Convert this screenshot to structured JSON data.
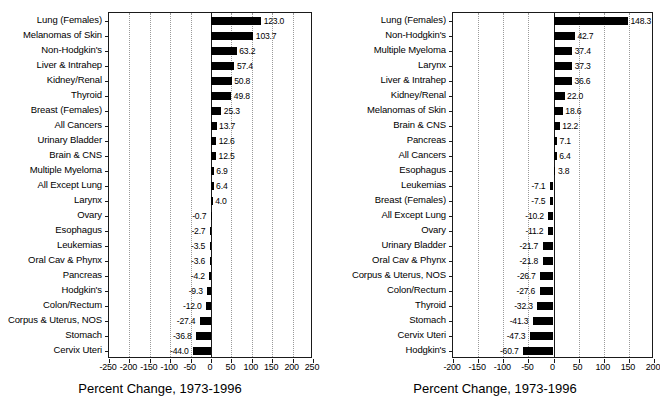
{
  "figure": {
    "background_color": "#ffffff",
    "bar_color": "#000000",
    "axis_color": "#1a1a1a",
    "grid_color": "#9a9a9a"
  },
  "charts": [
    {
      "id": "left",
      "title": "",
      "axis_title": "Percent Change, 1973-1996",
      "type": "bar",
      "orientation": "horizontal",
      "xlabel": "Percent Change, 1973-1996",
      "ylabel": "",
      "xlim": [
        -250,
        250
      ],
      "xticks": [
        -250,
        -200,
        -150,
        -100,
        -50,
        0,
        50,
        100,
        150,
        200,
        250
      ],
      "xticklabels": [
        "-250",
        "-200",
        "-150",
        "-100",
        "-50",
        "0",
        "50",
        "100",
        "150",
        "200",
        "250"
      ],
      "grid": true,
      "legend": "none",
      "categories": [
        "Lung (Females)",
        "Melanomas of Skin",
        "Non-Hodgkin's",
        "Liver & Intrahep",
        "Kidney/Renal",
        "Thyroid",
        "Breast (Females)",
        "All Cancers",
        "Urinary Bladder",
        "Brain & CNS",
        "Multiple Myeloma",
        "All Except Lung",
        "Larynx",
        "Ovary",
        "Esophagus",
        "Leukemias",
        "Oral Cav & Phynx",
        "Pancreas",
        "Hodgkin's",
        "Colon/Rectum",
        "Corpus & Uterus, NOS",
        "Stomach",
        "Cervix Uteri"
      ],
      "values": [
        123.0,
        103.7,
        63.2,
        57.4,
        50.8,
        49.8,
        25.3,
        13.7,
        12.6,
        12.5,
        6.9,
        6.4,
        4.0,
        -0.7,
        -2.7,
        -3.5,
        -3.6,
        -4.2,
        -9.3,
        -12.0,
        -27.4,
        -36.8,
        -44.0
      ],
      "datalabels": [
        "123.0",
        "103.7",
        "63.2",
        "57.4",
        "50.8",
        "49.8",
        "25.3",
        "13.7",
        "12.6",
        "12.5",
        "6.9",
        "6.4",
        "4.0",
        "-0.7",
        "-2.7",
        "-3.5",
        "-3.6",
        "-4.2",
        "-9.3",
        "-12.0",
        "-27.4",
        "-36.8",
        "-44.0"
      ]
    },
    {
      "id": "right",
      "title": "",
      "axis_title": "Percent Change, 1973-1996",
      "type": "bar",
      "orientation": "horizontal",
      "xlabel": "Percent Change, 1973-1996",
      "ylabel": "",
      "xlim": [
        -200,
        200
      ],
      "xticks": [
        -200,
        -150,
        -100,
        -50,
        0,
        50,
        100,
        150,
        200
      ],
      "xticklabels": [
        "-200",
        "-150",
        "-100",
        "-50",
        "0",
        "50",
        "100",
        "150",
        "200"
      ],
      "grid": true,
      "legend": "none",
      "categories": [
        "Lung (Females)",
        "Non-Hodgkin's",
        "Multiple Myeloma",
        "Larynx",
        "Liver & Intrahep",
        "Kidney/Renal",
        "Melanomas of Skin",
        "Brain & CNS",
        "Pancreas",
        "All Cancers",
        "Esophagus",
        "Leukemias",
        "Breast (Females)",
        "All Except Lung",
        "Ovary",
        "Urinary Bladder",
        "Oral Cav & Phynx",
        "Corpus & Uterus, NOS",
        "Colon/Rectum",
        "Thyroid",
        "Stomach",
        "Cervix Uteri",
        "Hodgkin's"
      ],
      "values": [
        148.3,
        42.7,
        37.4,
        37.3,
        36.6,
        22.0,
        18.6,
        12.2,
        7.1,
        6.4,
        3.8,
        -7.1,
        -7.5,
        -10.2,
        -11.2,
        -21.7,
        -21.8,
        -26.7,
        -27.6,
        -32.3,
        -41.3,
        -47.3,
        -60.7
      ],
      "datalabels": [
        "148.3",
        "42.7",
        "37.4",
        "37.3",
        "36.6",
        "22.0",
        "18.6",
        "12.2",
        "7.1",
        "6.4",
        "3.8",
        "-7.1",
        "-7.5",
        "-10.2",
        "-11.2",
        "-21.7",
        "-21.8",
        "-26.7",
        "-27.6",
        "-32.3",
        "-41.3",
        "-47.3",
        "-60.7"
      ]
    }
  ],
  "chart_data": [
    {
      "type": "bar",
      "orientation": "horizontal",
      "title": "Percent Change, 1973-1996",
      "xlabel": "Percent Change, 1973-1996",
      "ylabel": "",
      "xlim": [
        -250,
        250
      ],
      "grid": true,
      "legend": "none",
      "categories": [
        "Lung (Females)",
        "Melanomas of Skin",
        "Non-Hodgkin's",
        "Liver & Intrahep",
        "Kidney/Renal",
        "Thyroid",
        "Breast (Females)",
        "All Cancers",
        "Urinary Bladder",
        "Brain & CNS",
        "Multiple Myeloma",
        "All Except Lung",
        "Larynx",
        "Ovary",
        "Esophagus",
        "Leukemias",
        "Oral Cav & Phynx",
        "Pancreas",
        "Hodgkin's",
        "Colon/Rectum",
        "Corpus & Uterus, NOS",
        "Stomach",
        "Cervix Uteri"
      ],
      "values": [
        123.0,
        103.7,
        63.2,
        57.4,
        50.8,
        49.8,
        25.3,
        13.7,
        12.6,
        12.5,
        6.9,
        6.4,
        4.0,
        -0.7,
        -2.7,
        -3.5,
        -3.6,
        -4.2,
        -9.3,
        -12.0,
        -27.4,
        -36.8,
        -44.0
      ]
    },
    {
      "type": "bar",
      "orientation": "horizontal",
      "title": "Percent Change, 1973-1996",
      "xlabel": "Percent Change, 1973-1996",
      "ylabel": "",
      "xlim": [
        -200,
        200
      ],
      "grid": true,
      "legend": "none",
      "categories": [
        "Lung (Females)",
        "Non-Hodgkin's",
        "Multiple Myeloma",
        "Larynx",
        "Liver & Intrahep",
        "Kidney/Renal",
        "Melanomas of Skin",
        "Brain & CNS",
        "Pancreas",
        "All Cancers",
        "Esophagus",
        "Leukemias",
        "Breast (Females)",
        "All Except Lung",
        "Ovary",
        "Urinary Bladder",
        "Oral Cav & Phynx",
        "Corpus & Uterus, NOS",
        "Colon/Rectum",
        "Thyroid",
        "Stomach",
        "Cervix Uteri",
        "Hodgkin's"
      ],
      "values": [
        148.3,
        42.7,
        37.4,
        37.3,
        36.6,
        22.0,
        18.6,
        12.2,
        7.1,
        6.4,
        3.8,
        -7.1,
        -7.5,
        -10.2,
        -11.2,
        -21.7,
        -21.8,
        -26.7,
        -27.6,
        -32.3,
        -41.3,
        -47.3,
        -60.7
      ]
    }
  ]
}
